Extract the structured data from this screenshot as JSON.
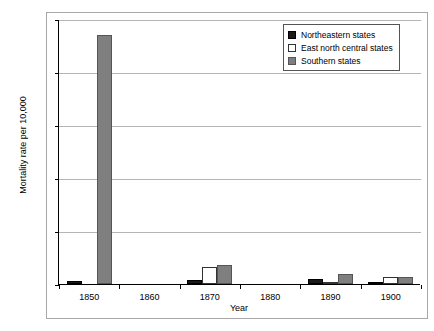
{
  "chart_data": {
    "type": "bar",
    "title": "",
    "xlabel": "Year",
    "ylabel": "Mortality rate per 10,000",
    "categories": [
      "1850",
      "1860",
      "1870",
      "1880",
      "1890",
      "1900"
    ],
    "series": [
      {
        "name": "Northeastern states",
        "color": "#1a1a1a",
        "values": [
          0.003,
          0.0,
          0.004,
          0.0,
          0.005,
          0.002
        ]
      },
      {
        "name": "East north central states",
        "color": "#ffffff",
        "values": [
          0.0,
          0.0,
          0.016,
          0.0,
          0.001,
          0.007
        ]
      },
      {
        "name": "Southern states",
        "color": "#7f7f7f",
        "values": [
          0.235,
          0.0,
          0.018,
          0.0,
          0.009,
          0.007
        ]
      }
    ],
    "ylim": [
      0,
      0.25
    ],
    "yticks": [
      "0.00",
      "0.05",
      "0.10",
      "0.15",
      "0.20",
      "0.25"
    ],
    "ytick_values": [
      0,
      0.05,
      0.1,
      0.15,
      0.2,
      0.25
    ],
    "grid": true,
    "legend_position": "top-right"
  },
  "legend": {
    "entries": [
      {
        "label": "Northeastern states"
      },
      {
        "label": "East north central states"
      },
      {
        "label": "Southern states"
      }
    ]
  }
}
